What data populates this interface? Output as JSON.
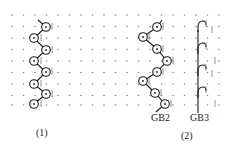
{
  "figure": {
    "background": "#ffffff",
    "ink_color": "#1a1a1a",
    "dot_color": "#8a8a8a",
    "grid": {
      "columns_x": [
        12,
        23.5,
        35,
        46.5,
        58,
        69.5,
        81,
        92.5,
        104,
        115.5,
        127,
        138.5,
        150,
        161.5,
        173,
        184.5,
        196,
        207.5,
        219
      ],
      "rows_y": [
        15,
        26.5,
        38,
        49.5,
        61,
        72.5,
        84,
        95.5,
        105
      ]
    },
    "panels": [
      {
        "id": "1",
        "caption": "(1)",
        "caption_pos": [
          36,
          128
        ],
        "knots": [
          [
            46,
            27
          ],
          [
            34,
            38
          ],
          [
            46,
            50
          ],
          [
            34,
            61
          ],
          [
            46,
            72
          ],
          [
            34,
            84
          ],
          [
            46,
            94
          ],
          [
            34,
            104
          ]
        ],
        "tail_start": [
          38,
          20
        ],
        "tail_end": null,
        "ticks": [
          [
            52,
            27
          ],
          [
            41,
            38
          ],
          [
            52,
            50
          ],
          [
            41,
            61
          ],
          [
            52,
            72
          ],
          [
            41,
            84
          ],
          [
            52,
            94
          ],
          [
            41,
            104
          ]
        ]
      },
      {
        "id": "2",
        "caption": "(2)",
        "caption_pos": [
          181,
          131
        ],
        "members": [
          {
            "name": "GB2",
            "label": "GB2",
            "label_pos": [
              151,
              113
            ],
            "knots": [
              [
                157,
                27
              ],
              [
                143,
                37
              ],
              [
                157,
                49
              ],
              [
                167,
                61
              ],
              [
                157,
                72
              ],
              [
                143,
                81
              ],
              [
                155,
                93
              ],
              [
                165,
                104
              ]
            ],
            "tail_start": [
              162,
              20
            ],
            "tail_end": [
              156,
              112
            ],
            "ticks": [
              [
                163,
                27
              ],
              [
                149,
                37
              ],
              [
                163,
                49
              ],
              [
                173,
                61
              ],
              [
                163,
                72
              ],
              [
                149,
                81
              ],
              [
                161,
                93
              ],
              [
                171,
                104
              ]
            ]
          },
          {
            "name": "GB3",
            "label": "GB3",
            "label_pos": [
              190,
              113
            ],
            "stem_x": 198,
            "stem_top": 24,
            "stem_bottom": 113,
            "hooks_y": [
              24,
              46,
              68,
              90
            ],
            "ticks": [
              [
                206,
                24
              ],
              [
                212,
                30
              ],
              [
                206,
                46
              ],
              [
                215,
                61
              ],
              [
                206,
                68
              ],
              [
                212,
                74
              ],
              [
                206,
                90
              ],
              [
                215,
                104
              ]
            ]
          }
        ]
      }
    ]
  }
}
